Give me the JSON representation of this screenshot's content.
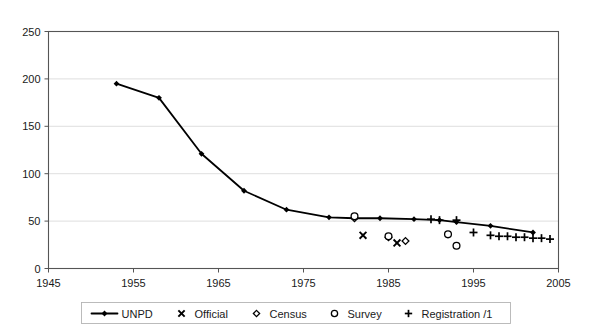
{
  "chart_data": {
    "type": "line",
    "title": "",
    "subtitle": "",
    "xlabel": "",
    "ylabel": "",
    "xlim": [
      1945,
      2005
    ],
    "ylim": [
      0,
      250
    ],
    "x_ticks": [
      1945,
      1955,
      1965,
      1975,
      1985,
      1995,
      2005
    ],
    "y_ticks": [
      0,
      50,
      100,
      150,
      200,
      250
    ],
    "x_tick_labels": [
      "1945",
      "1955",
      "1965",
      "1975",
      "1985",
      "1995",
      "2005"
    ],
    "y_tick_labels": [
      "0",
      "50",
      "100",
      "150",
      "200",
      "250"
    ],
    "grid": "horizontal",
    "legend_position": "bottom",
    "series": [
      {
        "name": "UNPD",
        "marker": "diamond-filled",
        "style": "line-with-markers",
        "points": [
          {
            "x": 1953,
            "y": 195
          },
          {
            "x": 1958,
            "y": 180
          },
          {
            "x": 1963,
            "y": 121
          },
          {
            "x": 1968,
            "y": 82
          },
          {
            "x": 1973,
            "y": 62
          },
          {
            "x": 1978,
            "y": 54
          },
          {
            "x": 1981,
            "y": 53
          },
          {
            "x": 1984,
            "y": 53
          },
          {
            "x": 1988,
            "y": 52
          },
          {
            "x": 1991,
            "y": 51
          },
          {
            "x": 1993,
            "y": 49
          },
          {
            "x": 1997,
            "y": 45
          },
          {
            "x": 2002,
            "y": 38
          }
        ]
      },
      {
        "name": "Official",
        "marker": "cross",
        "style": "scatter",
        "points": [
          {
            "x": 1982,
            "y": 35
          },
          {
            "x": 1986,
            "y": 27
          }
        ]
      },
      {
        "name": "Census",
        "marker": "diamond-open",
        "style": "scatter",
        "points": [
          {
            "x": 1981,
            "y": 53
          },
          {
            "x": 1985,
            "y": 33
          },
          {
            "x": 1987,
            "y": 29
          }
        ]
      },
      {
        "name": "Survey",
        "marker": "circle-open",
        "style": "scatter",
        "points": [
          {
            "x": 1981,
            "y": 55
          },
          {
            "x": 1985,
            "y": 34
          },
          {
            "x": 1992,
            "y": 36
          },
          {
            "x": 1993,
            "y": 24
          }
        ]
      },
      {
        "name": "Registration /1",
        "marker": "plus",
        "style": "scatter",
        "points": [
          {
            "x": 1990,
            "y": 52
          },
          {
            "x": 1991,
            "y": 51
          },
          {
            "x": 1993,
            "y": 51
          },
          {
            "x": 1995,
            "y": 38
          },
          {
            "x": 1997,
            "y": 35
          },
          {
            "x": 1998,
            "y": 34
          },
          {
            "x": 1999,
            "y": 34
          },
          {
            "x": 2000,
            "y": 33
          },
          {
            "x": 2001,
            "y": 33
          },
          {
            "x": 2002,
            "y": 32
          },
          {
            "x": 2003,
            "y": 32
          },
          {
            "x": 2004,
            "y": 31
          }
        ]
      }
    ]
  },
  "legend": {
    "entries": [
      {
        "label": "UNPD",
        "marker": "line-diamond"
      },
      {
        "label": "Official",
        "marker": "cross"
      },
      {
        "label": "Census",
        "marker": "diamond-open"
      },
      {
        "label": "Survey",
        "marker": "circle-open"
      },
      {
        "label": "Registration /1",
        "marker": "plus"
      }
    ]
  },
  "colors": {
    "series": "#000000",
    "grid": "#d6d6d6",
    "border": "#555555",
    "background": "#ffffff",
    "text": "#1a1a1a"
  }
}
